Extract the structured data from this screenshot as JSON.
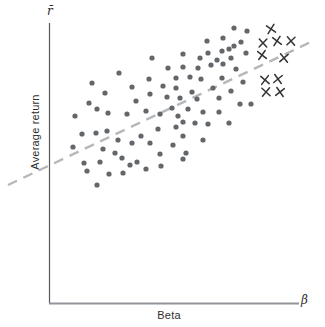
{
  "figure": {
    "y_axis_label": "Average return",
    "x_axis_label": "Beta",
    "y_axis_end_symbol": "r̄",
    "x_axis_end_symbol": "β"
  },
  "colors": {
    "background": "#ffffff",
    "dot": "#63666a",
    "x_marker": "#333333",
    "trend_line": "#b5b8bb",
    "y_axis": "#55575a",
    "x_axis": "#919498",
    "text": "#2e2e2e"
  },
  "chart_data": {
    "type": "scatter",
    "title": "",
    "xlabel": "Beta",
    "ylabel": "Average return",
    "axis_ticks": "none",
    "grid": false,
    "legend": "none",
    "coords": "px (origin top-left of 325x327 canvas)",
    "series": [
      {
        "name": "dot-points",
        "marker": "circle",
        "color": "#63666a",
        "points": [
          [
            152,
            58
          ],
          [
            119,
            73
          ],
          [
            149,
            79
          ],
          [
            92,
            83
          ],
          [
            132,
            87
          ],
          [
            105,
            93
          ],
          [
            150,
            94
          ],
          [
            136,
            101
          ],
          [
            89,
            103
          ],
          [
            97,
            109
          ],
          [
            146,
            111
          ],
          [
            108,
            113
          ],
          [
            75,
            116
          ],
          [
            127,
            114
          ],
          [
            160,
            114
          ],
          [
            82,
            134
          ],
          [
            96,
            133
          ],
          [
            107,
            131
          ],
          [
            141,
            136
          ],
          [
            118,
            140
          ],
          [
            132,
            143
          ],
          [
            150,
            143
          ],
          [
            158,
            129
          ],
          [
            73,
            147
          ],
          [
            103,
            149
          ],
          [
            115,
            153
          ],
          [
            160,
            154
          ],
          [
            84,
            163
          ],
          [
            100,
            162
          ],
          [
            122,
            158
          ],
          [
            130,
            165
          ],
          [
            137,
            162
          ],
          [
            146,
            169
          ],
          [
            161,
            166
          ],
          [
            87,
            171
          ],
          [
            109,
            174
          ],
          [
            123,
            173
          ],
          [
            97,
            185
          ],
          [
            234,
            28
          ],
          [
            247,
            31
          ],
          [
            207,
            41
          ],
          [
            223,
            38
          ],
          [
            241,
            42
          ],
          [
            229,
            49
          ],
          [
            222,
            51
          ],
          [
            234,
            46
          ],
          [
            208,
            53
          ],
          [
            246,
            53
          ],
          [
            183,
            54
          ],
          [
            200,
            58
          ],
          [
            217,
            60
          ],
          [
            231,
            58
          ],
          [
            211,
            65
          ],
          [
            223,
            64
          ],
          [
            168,
            68
          ],
          [
            183,
            67
          ],
          [
            198,
            68
          ],
          [
            236,
            69
          ],
          [
            176,
            78
          ],
          [
            190,
            77
          ],
          [
            201,
            79
          ],
          [
            222,
            78
          ],
          [
            243,
            82
          ],
          [
            163,
            86
          ],
          [
            176,
            88
          ],
          [
            192,
            92
          ],
          [
            213,
            88
          ],
          [
            231,
            91
          ],
          [
            167,
            97
          ],
          [
            180,
            98
          ],
          [
            197,
            99
          ],
          [
            219,
            98
          ],
          [
            240,
            104
          ],
          [
            251,
            104
          ],
          [
            172,
            108
          ],
          [
            188,
            109
          ],
          [
            203,
            112
          ],
          [
            219,
            112
          ],
          [
            178,
            116
          ],
          [
            183,
            122
          ],
          [
            195,
            123
          ],
          [
            208,
            124
          ],
          [
            229,
            123
          ],
          [
            176,
            127
          ],
          [
            183,
            136
          ],
          [
            203,
            140
          ],
          [
            173,
            145
          ],
          [
            186,
            153
          ],
          [
            183,
            159
          ]
        ]
      },
      {
        "name": "x-points",
        "marker": "x",
        "color": "#333333",
        "points": [
          [
            271,
            29
          ],
          [
            263,
            43
          ],
          [
            277,
            41
          ],
          [
            291,
            41
          ],
          [
            262,
            55
          ],
          [
            284,
            58
          ],
          [
            265,
            80
          ],
          [
            278,
            79
          ],
          [
            266,
            92
          ],
          [
            280,
            92
          ]
        ]
      }
    ],
    "trend_line": {
      "style": "dashed",
      "color": "#b5b8bb",
      "from": [
        8,
        185
      ],
      "to": [
        315,
        40
      ]
    },
    "axes_px": {
      "y_axis": {
        "x": 49.5,
        "y_top": 23,
        "y_bottom": 303.5
      },
      "x_axis": {
        "y": 303.5,
        "x_left": 49,
        "x_right": 299
      }
    }
  }
}
